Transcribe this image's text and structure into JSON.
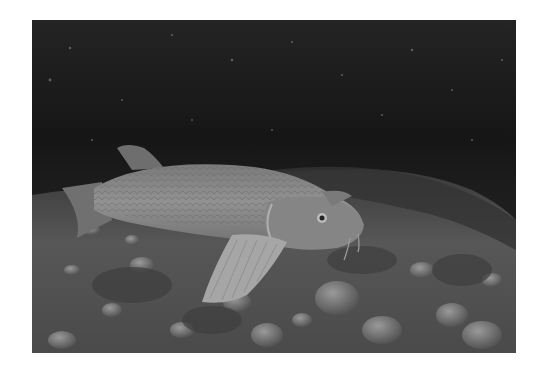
{
  "image": {
    "description": "Grayscale underwater photograph of a large barbel fish resting on a pebbly riverbed with algae",
    "colors": {
      "water_dark": "#141414",
      "water_mid": "#2a2a2a",
      "fish_body": "#8a8a8a",
      "fish_highlight": "#a8a8a8",
      "riverbed": "#6a6a6a",
      "background": "#ffffff"
    }
  }
}
